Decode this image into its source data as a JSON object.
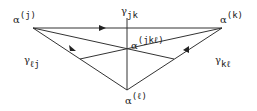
{
  "diagram": {
    "nodes": [
      {
        "id": "j",
        "symbol": "α",
        "index": "(j)"
      },
      {
        "id": "k",
        "symbol": "α",
        "index": "(k)"
      },
      {
        "id": "l",
        "symbol": "α",
        "index": "(ℓ)"
      },
      {
        "id": "jkl",
        "symbol": "α",
        "index": "(jkℓ)"
      }
    ],
    "edges": [
      {
        "from": "j",
        "to": "k",
        "symbol": "γ",
        "index": "jk"
      },
      {
        "from": "k",
        "to": "l",
        "symbol": "γ",
        "index": "kℓ"
      },
      {
        "from": "l",
        "to": "j",
        "symbol": "γ",
        "index": "ℓj"
      }
    ]
  }
}
